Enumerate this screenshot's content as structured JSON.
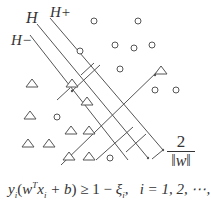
{
  "diagram": {
    "type": "svm-margin",
    "labels": {
      "hyperplane": "H",
      "positive_margin": "H+",
      "negative_margin": "H−"
    },
    "margin_width": {
      "numerator": "2",
      "denominator": "‖w‖"
    },
    "formula": {
      "lhs": "y",
      "lhs_sub": "i",
      "open": "(",
      "w": "w",
      "sup": "T",
      "x": "x",
      "x_sub": "i",
      "plus_b": " + b",
      "close": ")",
      "rel": " ≥ 1 − ",
      "xi": "ξ",
      "xi_sub": "i",
      "sep": ",",
      "index": "i = 1, 2, ⋯, n"
    },
    "colors": {
      "stroke": "#555555",
      "text": "#333333"
    },
    "circles": [
      [
        94,
        21
      ],
      [
        138,
        46
      ],
      [
        115,
        50
      ],
      [
        152,
        52
      ],
      [
        93,
        51
      ],
      [
        121,
        69
      ],
      [
        154,
        84
      ],
      [
        175,
        90
      ]
    ],
    "triangles": [
      [
        32,
        85
      ],
      [
        37,
        113
      ],
      [
        57,
        113
      ],
      [
        71,
        106
      ],
      [
        89,
        108
      ],
      [
        69,
        128
      ],
      [
        89,
        131
      ],
      [
        28,
        141
      ],
      [
        49,
        141
      ],
      [
        68,
        153
      ],
      [
        88,
        155
      ]
    ]
  }
}
